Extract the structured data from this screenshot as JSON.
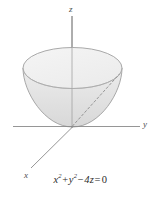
{
  "figure": {
    "type": "3d-surface-plot",
    "surface_name": "circular-paraboloid",
    "caption": "x² + y² − 4z = 0",
    "equation_parts": {
      "term1_base": "x",
      "term1_exp": "2",
      "plus": "+",
      "term2_base": "y",
      "term2_exp": "2",
      "minus": "−",
      "term3": "4z",
      "equals": "=",
      "rhs": "0"
    },
    "axes": [
      {
        "id": "z",
        "label": "z",
        "orientation": "vertical",
        "label_x": 69,
        "label_y": 12
      },
      {
        "id": "y",
        "label": "y",
        "orientation": "horizontal-right",
        "label_x": 143,
        "label_y": 127
      },
      {
        "id": "x",
        "label": "x",
        "orientation": "diagonal-lower-left",
        "label_x": 24,
        "label_y": 178
      }
    ],
    "colors": {
      "background": "#ffffff",
      "axis_stroke": "#808080",
      "surface_outline": "#9a9a9a",
      "surface_top_fill": "#f1f1f1",
      "surface_body_fill": "#e2e2e2",
      "dashed_stroke": "#8c8c8c",
      "text": "#2b2b2b"
    },
    "geometry": {
      "origin_x": 72,
      "origin_y": 127,
      "ellipse_center_x": 72.5,
      "ellipse_center_y": 68,
      "ellipse_rx": 49.5,
      "ellipse_ry": 20.5,
      "bowl_depth": 59
    }
  }
}
